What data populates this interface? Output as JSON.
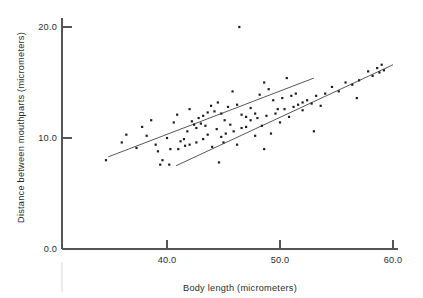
{
  "chart_data": {
    "type": "scatter",
    "title": "",
    "xlabel": "Body length (micrometers)",
    "ylabel": "Distance between mouthparts (micrometers)",
    "xlim": [
      32.2,
      62.0
    ],
    "ylim": [
      0.0,
      21.5
    ],
    "xticks": [
      40.0,
      50.0,
      60.0
    ],
    "xticklabels": [
      "40.0",
      "50.0",
      "60.0"
    ],
    "yticks": [
      0.0,
      10.0,
      20.0
    ],
    "yticklabels": [
      "0.0",
      "10.0",
      "20.0"
    ],
    "grid": false,
    "legend": null,
    "series": [
      {
        "name": "upper-group-points",
        "marker": "square",
        "points": [
          [
            34.6,
            8.0
          ],
          [
            36.0,
            9.6
          ],
          [
            36.4,
            10.3
          ],
          [
            37.3,
            9.1
          ],
          [
            37.8,
            11.0
          ],
          [
            38.2,
            10.2
          ],
          [
            38.6,
            11.6
          ],
          [
            39.0,
            9.4
          ],
          [
            39.2,
            8.8
          ],
          [
            39.4,
            7.6
          ],
          [
            39.6,
            8.0
          ],
          [
            40.0,
            10.0
          ],
          [
            40.3,
            9.0
          ],
          [
            40.6,
            11.4
          ],
          [
            40.9,
            12.1
          ],
          [
            41.2,
            9.7
          ],
          [
            41.5,
            9.9
          ],
          [
            41.8,
            10.6
          ],
          [
            42.0,
            12.6
          ],
          [
            42.2,
            11.5
          ],
          [
            42.4,
            11.2
          ],
          [
            42.6,
            10.9
          ],
          [
            42.8,
            11.8
          ],
          [
            43.0,
            11.3
          ],
          [
            43.2,
            12.0
          ],
          [
            43.4,
            11.1
          ],
          [
            43.6,
            12.3
          ],
          [
            43.9,
            12.9
          ],
          [
            44.2,
            12.4
          ],
          [
            44.5,
            13.2
          ],
          [
            44.8,
            12.2
          ],
          [
            45.1,
            11.6
          ],
          [
            45.4,
            12.8
          ],
          [
            45.8,
            14.2
          ],
          [
            46.2,
            13.0
          ],
          [
            46.6,
            12.1
          ],
          [
            47.0,
            11.9
          ],
          [
            47.4,
            12.7
          ],
          [
            47.8,
            12.2
          ],
          [
            48.2,
            13.9
          ],
          [
            48.6,
            15.0
          ],
          [
            49.0,
            14.4
          ],
          [
            49.4,
            13.4
          ],
          [
            49.8,
            12.6
          ],
          [
            50.2,
            13.6
          ],
          [
            50.6,
            15.4
          ],
          [
            51.0,
            13.8
          ],
          [
            51.4,
            14.0
          ],
          [
            46.4,
            20.0
          ],
          [
            52.0,
            13.2
          ]
        ]
      },
      {
        "name": "lower-group-points",
        "marker": "square",
        "points": [
          [
            40.2,
            7.6
          ],
          [
            41.0,
            9.0
          ],
          [
            41.6,
            9.3
          ],
          [
            42.0,
            9.4
          ],
          [
            42.6,
            9.6
          ],
          [
            43.2,
            9.9
          ],
          [
            43.6,
            10.3
          ],
          [
            44.0,
            9.2
          ],
          [
            44.4,
            10.8
          ],
          [
            44.8,
            10.1
          ],
          [
            45.0,
            9.6
          ],
          [
            45.2,
            10.4
          ],
          [
            45.6,
            11.2
          ],
          [
            45.9,
            10.6
          ],
          [
            46.2,
            9.4
          ],
          [
            46.6,
            10.9
          ],
          [
            47.0,
            11.0
          ],
          [
            47.4,
            11.6
          ],
          [
            47.8,
            10.2
          ],
          [
            48.0,
            11.8
          ],
          [
            48.4,
            11.1
          ],
          [
            48.8,
            12.0
          ],
          [
            49.2,
            10.4
          ],
          [
            49.6,
            12.2
          ],
          [
            50.0,
            11.4
          ],
          [
            50.4,
            12.6
          ],
          [
            50.8,
            11.9
          ],
          [
            51.2,
            12.8
          ],
          [
            51.6,
            13.0
          ],
          [
            52.0,
            12.5
          ],
          [
            52.4,
            13.4
          ],
          [
            52.8,
            13.1
          ],
          [
            53.2,
            13.8
          ],
          [
            53.6,
            12.9
          ],
          [
            54.0,
            14.0
          ],
          [
            54.6,
            14.6
          ],
          [
            55.2,
            14.2
          ],
          [
            55.8,
            15.0
          ],
          [
            56.4,
            14.8
          ],
          [
            57.0,
            15.2
          ],
          [
            57.8,
            16.0
          ],
          [
            58.2,
            15.6
          ],
          [
            58.6,
            16.3
          ],
          [
            58.8,
            15.9
          ],
          [
            59.0,
            16.6
          ],
          [
            59.2,
            16.1
          ],
          [
            56.8,
            13.6
          ],
          [
            53.0,
            10.6
          ],
          [
            48.6,
            9.0
          ],
          [
            44.6,
            7.8
          ]
        ]
      }
    ],
    "fit_lines": [
      {
        "name": "upper-regression-line",
        "x_start": 34.8,
        "y_start": 8.3,
        "x_end": 53.0,
        "y_end": 15.4
      },
      {
        "name": "lower-regression-line",
        "x_start": 40.8,
        "y_start": 7.5,
        "x_end": 60.0,
        "y_end": 16.6
      }
    ]
  }
}
